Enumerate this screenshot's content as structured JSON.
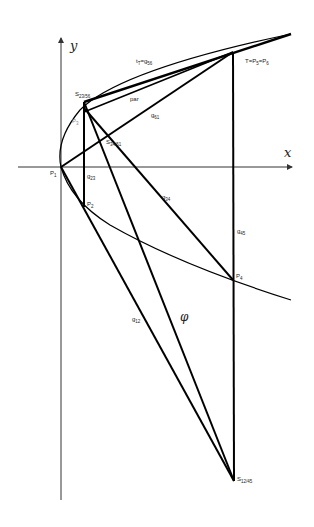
{
  "diagram": {
    "axes": {
      "x_label": "x",
      "y_label": "y"
    },
    "labels": {
      "P1": "P",
      "P1_sub": "1",
      "P2": "P",
      "P2_sub": "2",
      "P3": "P",
      "P3_sub": "3",
      "P4": "P",
      "P4_sub": "4",
      "T": "T=P",
      "T_sub5": "5",
      "T_eq": "=P",
      "T_sub6": "6",
      "S23_56": "S",
      "S23_56_sub": "23/56",
      "S34_61": "S",
      "S34_61_sub": "34/61",
      "S12_45": "S",
      "S12_45_sub": "12/45",
      "tT": "t",
      "tT_sub": "T",
      "tT_eq": "=g",
      "tT_sub2": "56",
      "par": "par",
      "g61": "g",
      "g61_sub": "61",
      "g23": "g",
      "g23_sub": "23",
      "g34": "g",
      "g34_sub": "34",
      "g45": "g",
      "g45_sub": "45",
      "g12": "g",
      "g12_sub": "12",
      "phi": "φ"
    },
    "colors": {
      "line": "#000000",
      "axis": "#333333",
      "label": "#222222",
      "p3_label": "#888888"
    }
  }
}
